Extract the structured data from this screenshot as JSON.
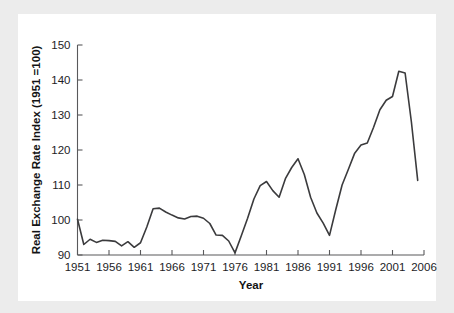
{
  "figure": {
    "background_color": "#ececec",
    "card_color": "#ffffff",
    "line_color": "#3b3b3d",
    "axis_color": "#59595b"
  },
  "chart_data": {
    "type": "line",
    "title": "",
    "xlabel": "Year",
    "ylabel": "Real Exchange Rate Index (1951 =100)",
    "xlim": [
      1951,
      2006
    ],
    "ylim": [
      90,
      150
    ],
    "yticks": [
      90,
      100,
      110,
      120,
      130,
      140,
      150
    ],
    "ytick_labels": [
      "90",
      "100",
      "110",
      "120",
      "130",
      "140",
      "150"
    ],
    "xticks": [
      1951,
      1956,
      1961,
      1966,
      1971,
      1976,
      1981,
      1986,
      1991,
      1996,
      2001,
      2006
    ],
    "xtick_labels": [
      "1951",
      "1956",
      "1961",
      "1966",
      "1971",
      "1976",
      "1981",
      "1986",
      "1991",
      "1996",
      "2001",
      "2006"
    ],
    "grid": false,
    "legend": false,
    "x": [
      1951,
      1952,
      1953,
      1954,
      1955,
      1956,
      1957,
      1958,
      1959,
      1960,
      1961,
      1962,
      1963,
      1964,
      1965,
      1966,
      1967,
      1968,
      1969,
      1970,
      1971,
      1972,
      1973,
      1974,
      1975,
      1976,
      1977,
      1978,
      1979,
      1980,
      1981,
      1982,
      1983,
      1984,
      1985,
      1986,
      1987,
      1988,
      1989,
      1990,
      1991,
      1992,
      1993,
      1994,
      1995,
      1996,
      1997,
      1998,
      1999,
      2000,
      2001,
      2002,
      2003,
      2004,
      2005
    ],
    "values": [
      100.2,
      93.0,
      94.5,
      93.6,
      94.2,
      94.1,
      93.9,
      92.6,
      93.8,
      92.2,
      93.5,
      98.0,
      103.2,
      103.4,
      102.3,
      101.4,
      100.6,
      100.3,
      101.0,
      101.1,
      100.5,
      99.0,
      95.7,
      95.6,
      94.0,
      90.6,
      95.5,
      100.5,
      106.0,
      109.8,
      111.0,
      108.4,
      106.5,
      111.8,
      115.0,
      117.5,
      113.0,
      106.5,
      102.0,
      99.1,
      95.6,
      103.0,
      110.0,
      114.5,
      119.1,
      121.4,
      122.0,
      126.5,
      131.5,
      134.2,
      135.3,
      142.5,
      142.0,
      128.0,
      111.3
    ],
    "series_name": "Real Exchange Rate Index"
  }
}
